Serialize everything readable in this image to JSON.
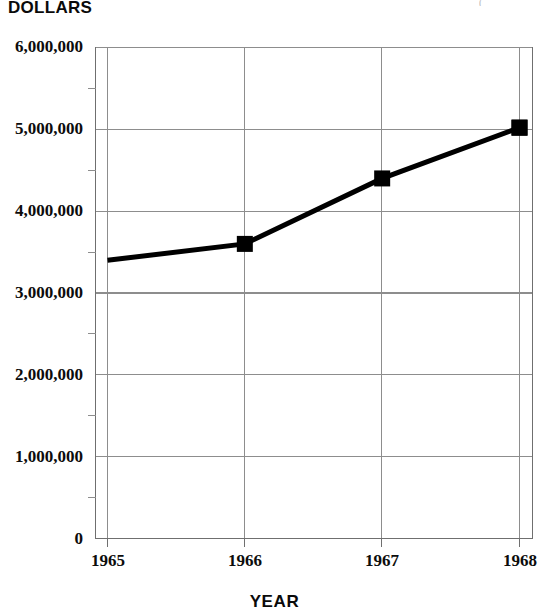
{
  "chart_data": {
    "type": "line",
    "title": "",
    "xlabel": "YEAR",
    "ylabel": "DOLLARS",
    "categories": [
      "1965",
      "1966",
      "1967",
      "1968"
    ],
    "x": [
      1965,
      1966,
      1967,
      1968
    ],
    "values": [
      3400000,
      3600000,
      4400000,
      5020000
    ],
    "series": [
      {
        "name": "Dollars",
        "values": [
          3400000,
          3600000,
          4400000,
          5020000
        ]
      }
    ],
    "ylim": [
      0,
      6000000
    ],
    "xlim": [
      1965,
      1968
    ],
    "y_major_step": 1000000,
    "y_minor_step": 500000,
    "ytick_labels": [
      "6,000,000",
      "5,000,000",
      "4,000,000",
      "3,000,000",
      "2,000,000",
      "1,000,000",
      "0"
    ],
    "ytick_values": [
      6000000,
      5000000,
      4000000,
      3000000,
      2000000,
      1000000,
      0
    ],
    "xtick_labels": [
      "1965",
      "1966",
      "1967",
      "1968"
    ],
    "grid": "both",
    "legend": "none",
    "marker": "square",
    "marker_color": "#000000",
    "line_color": "#000000",
    "grid_color": "#8d8d8d",
    "axis_color": "#6f6f6f",
    "background": "#ffffff"
  },
  "axes": {
    "y_title": "DOLLARS",
    "x_title": "YEAR"
  },
  "marks": {
    "corner_fragment": "("
  }
}
